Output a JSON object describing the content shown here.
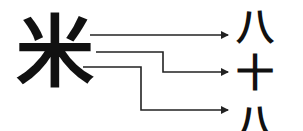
{
  "diagram": {
    "source": {
      "char": "米"
    },
    "targets": [
      {
        "char": "八"
      },
      {
        "char": "十"
      },
      {
        "char": "八"
      }
    ],
    "colors": {
      "line": "#222222",
      "text": "#111111",
      "background": "#ffffff"
    }
  }
}
